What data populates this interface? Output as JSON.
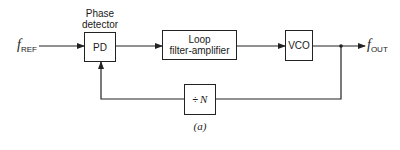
{
  "diagram": {
    "caption": "(a)",
    "input_signal": {
      "symbol": "f",
      "subscript": "REF"
    },
    "output_signal": {
      "symbol": "f",
      "subscript": "OUT"
    },
    "blocks": {
      "pd": {
        "label": "PD",
        "title_line1": "Phase",
        "title_line2": "detector"
      },
      "loop_filter": {
        "line1": "Loop",
        "line2": "filter-amplifier"
      },
      "vco": {
        "label": "VCO"
      },
      "divider": {
        "symbol": "÷",
        "variable": "N"
      }
    },
    "colors": {
      "stroke": "#222222",
      "background": "#ffffff"
    }
  }
}
